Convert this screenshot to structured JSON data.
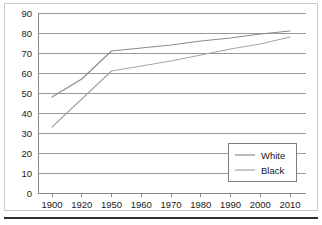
{
  "figure": {
    "frame_color": "#c9c9c9",
    "background": "#ffffff",
    "bottom_rule_color": "#2e2e2e"
  },
  "chart_data": {
    "type": "line",
    "title": "",
    "subtitle": "",
    "xlabel": "",
    "ylabel": "",
    "categories": [
      "1900",
      "1920",
      "1950",
      "1960",
      "1970",
      "1980",
      "1990",
      "2000",
      "2010"
    ],
    "series": [
      {
        "name": "White",
        "color": "#8c8c8c",
        "values": [
          48,
          57,
          71,
          72.5,
          74,
          76,
          77.5,
          79.5,
          81
        ]
      },
      {
        "name": "Black",
        "color": "#a6a6a6",
        "values": [
          33,
          47,
          61,
          63.5,
          66,
          69,
          72,
          74.5,
          78
        ]
      }
    ],
    "ylim": [
      0,
      90
    ],
    "ytick_step": 10,
    "yticks": [
      "0",
      "10",
      "20",
      "30",
      "40",
      "50",
      "60",
      "70",
      "80",
      "90"
    ],
    "xticks": [
      "1900",
      "1920",
      "1950",
      "1960",
      "1970",
      "1980",
      "1990",
      "2000",
      "2010"
    ],
    "grid": "horizontal",
    "grid_color": "#9a9a9a",
    "legend_position": "bottom-right",
    "legend_entries": [
      "White",
      "Black"
    ]
  }
}
